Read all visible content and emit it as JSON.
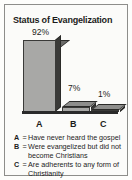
{
  "chart_data": {
    "type": "bar",
    "title": "Status of Evangelization",
    "categories": [
      "A",
      "B",
      "C"
    ],
    "values": [
      92,
      7,
      1
    ],
    "value_labels": [
      "92%",
      "7%",
      "1%"
    ],
    "xlabel": "",
    "ylabel": "",
    "ylim": [
      0,
      100
    ],
    "grid": false,
    "legend_position": "below-axis",
    "style": "3d-bar",
    "legend": [
      {
        "key": "A",
        "eq": "=",
        "text": "Have never heard the gospel"
      },
      {
        "key": "B",
        "eq": "=",
        "text": "Were evangelized but did not become Christians"
      },
      {
        "key": "C",
        "eq": "=",
        "text": "Are adherents to any form of Christianity"
      }
    ],
    "colors": {
      "bar_face": "#a8a8a6",
      "bar_top": "#6a6a68",
      "bar_side": "#3a3a38",
      "baseline": "#2a2a2a",
      "text": "#1b1b1b",
      "frame": "#8d8d8a",
      "background": "#fbfbf9"
    }
  }
}
